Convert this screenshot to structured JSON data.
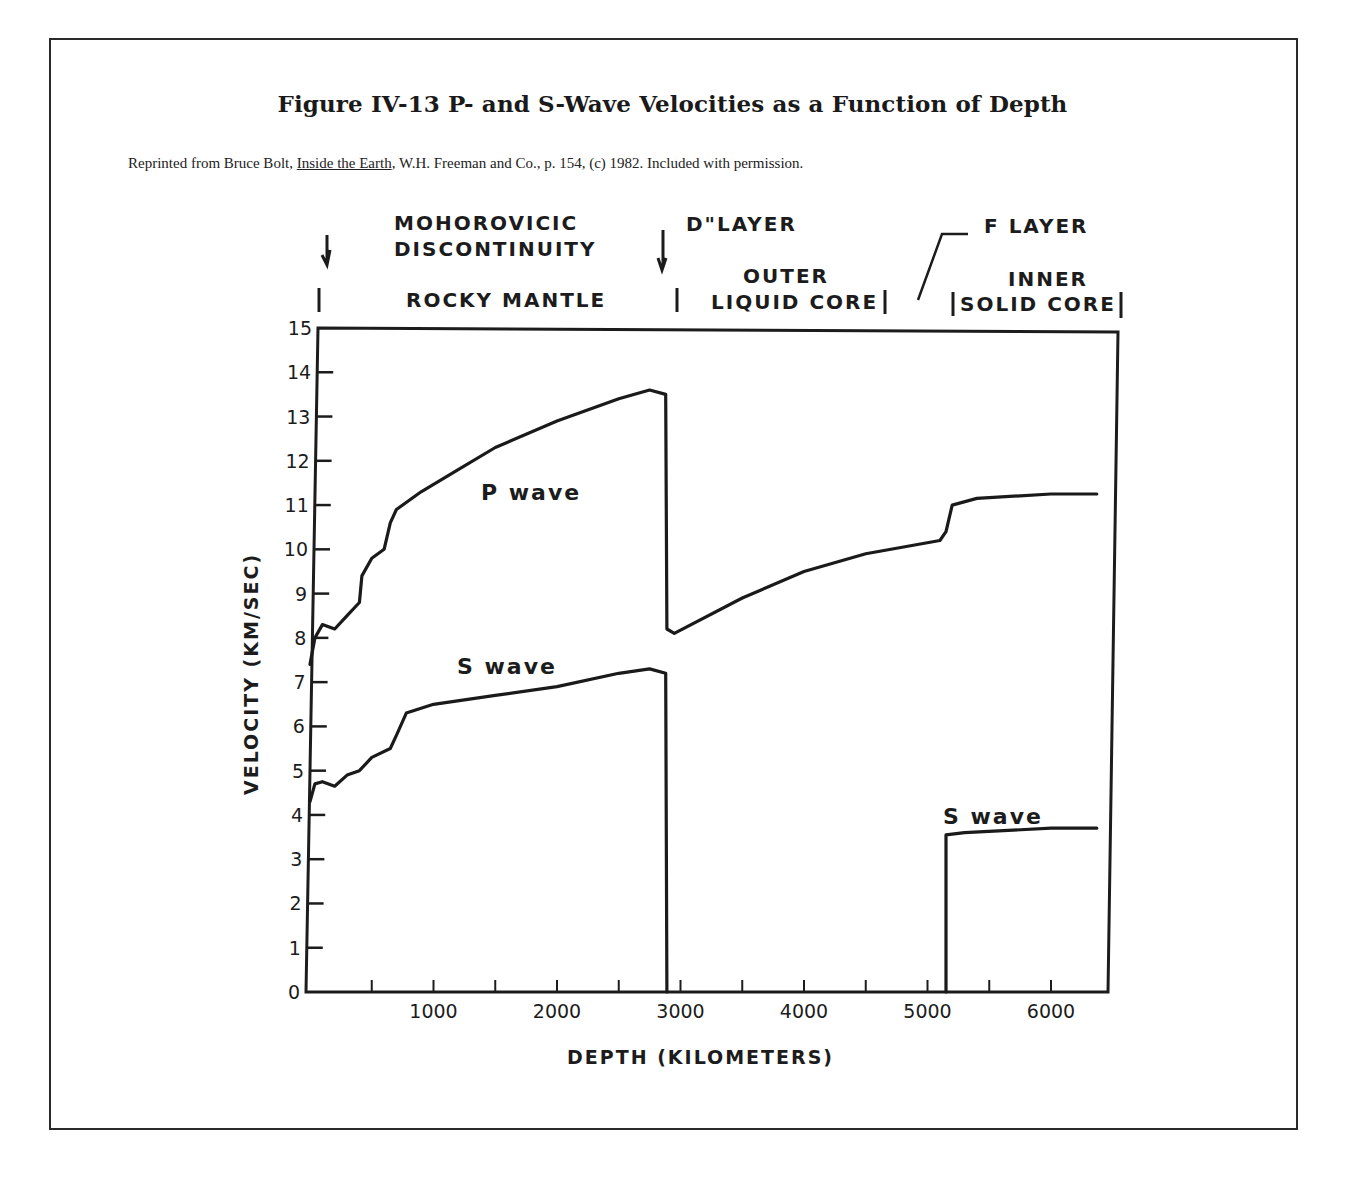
{
  "figure": {
    "title": "Figure IV-13  P- and S-Wave Velocities as a Function of Depth",
    "credit_prefix": "Reprinted from Bruce Bolt, ",
    "credit_book": "Inside the Earth",
    "credit_suffix": ", W.H. Freeman and Co., p. 154, (c) 1982. Included with permission."
  },
  "annotations": {
    "moho_line1": "MOHOROVICIC",
    "moho_line2": "DISCONTINUITY",
    "d_layer": "D\"LAYER",
    "f_layer": "F LAYER",
    "rocky_mantle": "ROCKY MANTLE",
    "outer_line1": "OUTER",
    "outer_line2": "LIQUID CORE",
    "inner_line1": "INNER",
    "inner_line2": "SOLID CORE",
    "p_wave": "P wave",
    "s_wave_mantle": "S wave",
    "s_wave_core": "S wave"
  },
  "chart_data": {
    "type": "line",
    "title": "P- and S-Wave Velocities as a Function of Depth",
    "xlabel": "DEPTH (KILOMETERS)",
    "ylabel": "VELOCITY (KM/SEC)",
    "xlim": [
      0,
      6400
    ],
    "ylim": [
      0,
      15
    ],
    "x_ticks": [
      1000,
      2000,
      3000,
      4000,
      5000,
      6000
    ],
    "x_minor_tick_step": 500,
    "y_ticks": [
      0,
      1,
      2,
      3,
      4,
      5,
      6,
      7,
      8,
      9,
      10,
      11,
      12,
      13,
      14,
      15
    ],
    "grid": false,
    "legend": "inline labels",
    "series": [
      {
        "name": "P wave",
        "points": [
          [
            0,
            7.4
          ],
          [
            40,
            8.0
          ],
          [
            100,
            8.3
          ],
          [
            200,
            8.2
          ],
          [
            300,
            8.5
          ],
          [
            400,
            8.8
          ],
          [
            420,
            9.4
          ],
          [
            500,
            9.8
          ],
          [
            600,
            10.0
          ],
          [
            650,
            10.6
          ],
          [
            700,
            10.9
          ],
          [
            900,
            11.3
          ],
          [
            1200,
            11.8
          ],
          [
            1500,
            12.3
          ],
          [
            2000,
            12.9
          ],
          [
            2500,
            13.4
          ],
          [
            2750,
            13.6
          ],
          [
            2880,
            13.5
          ],
          [
            2890,
            8.2
          ],
          [
            2950,
            8.1
          ],
          [
            3500,
            8.9
          ],
          [
            4000,
            9.5
          ],
          [
            4500,
            9.9
          ],
          [
            5100,
            10.2
          ],
          [
            5150,
            10.4
          ],
          [
            5200,
            11.0
          ],
          [
            5400,
            11.15
          ],
          [
            6000,
            11.25
          ],
          [
            6371,
            11.25
          ]
        ]
      },
      {
        "name": "S wave",
        "points": [
          [
            0,
            4.3
          ],
          [
            40,
            4.7
          ],
          [
            100,
            4.75
          ],
          [
            200,
            4.65
          ],
          [
            300,
            4.9
          ],
          [
            400,
            5.0
          ],
          [
            500,
            5.3
          ],
          [
            650,
            5.5
          ],
          [
            700,
            5.8
          ],
          [
            780,
            6.3
          ],
          [
            1000,
            6.5
          ],
          [
            1500,
            6.7
          ],
          [
            2000,
            6.9
          ],
          [
            2500,
            7.2
          ],
          [
            2750,
            7.3
          ],
          [
            2880,
            7.2
          ],
          [
            2890,
            0
          ]
        ]
      },
      {
        "name": "S wave (inner core)",
        "points": [
          [
            5150,
            0
          ],
          [
            5150,
            3.55
          ],
          [
            5300,
            3.6
          ],
          [
            6000,
            3.7
          ],
          [
            6371,
            3.7
          ]
        ]
      }
    ],
    "boundaries": [
      {
        "name": "Mohorovicic discontinuity",
        "depth_km": 35
      },
      {
        "name": "D\" layer / core-mantle boundary",
        "depth_km": 2890
      },
      {
        "name": "F layer",
        "depth_km": 5000
      },
      {
        "name": "Inner core boundary",
        "depth_km": 5150
      }
    ],
    "regions": [
      "ROCKY MANTLE",
      "OUTER LIQUID CORE",
      "INNER SOLID CORE"
    ]
  }
}
